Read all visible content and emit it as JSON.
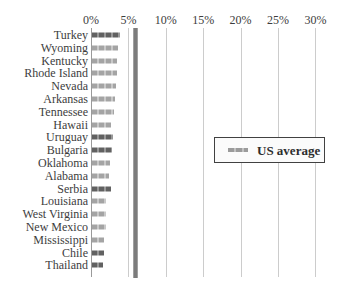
{
  "chart_data": {
    "type": "bar",
    "orientation": "horizontal",
    "title": "",
    "categories": [
      "Turkey",
      "Wyoming",
      "Kentucky",
      "Rhode Island",
      "Nevada",
      "Arkansas",
      "Tennessee",
      "Hawaii",
      "Uruguay",
      "Bulgaria",
      "Oklahoma",
      "Alabama",
      "Serbia",
      "Louisiana",
      "West Virginia",
      "New Mexico",
      "Mississippi",
      "Chile",
      "Thailand"
    ],
    "values": [
      3.7,
      3.5,
      3.4,
      3.3,
      3.2,
      3.1,
      2.9,
      2.6,
      2.8,
      2.7,
      2.4,
      2.2,
      2.5,
      1.9,
      1.8,
      1.8,
      1.6,
      1.6,
      1.5
    ],
    "unit": "%",
    "dark_bar_categories": [
      "Turkey",
      "Uruguay",
      "Bulgaria",
      "Serbia",
      "Chile",
      "Thailand"
    ],
    "x_ticks": [
      "0%",
      "5%",
      "10%",
      "15%",
      "20%",
      "25%",
      "30%"
    ],
    "x_tick_values": [
      0,
      5,
      10,
      15,
      20,
      25,
      30
    ],
    "xlim": [
      0,
      30
    ],
    "grid": "vertical-on",
    "reference_line": {
      "value": 6.0,
      "color": "#7c7c7c"
    },
    "legend": {
      "label": "US average",
      "position": "middle-right"
    },
    "colors": {
      "bar_light": "#a4a4a4",
      "bar_dark": "#616161",
      "gridline": "#cccccc",
      "axis_line": "#9a9a9a",
      "reference_line": "#7c7c7c",
      "text": "#3d3d3d"
    }
  }
}
